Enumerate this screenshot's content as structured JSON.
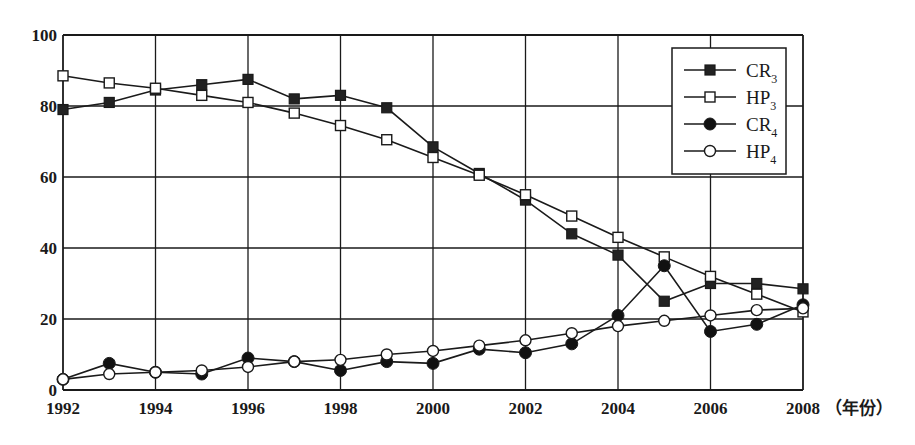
{
  "chart_data": {
    "type": "line",
    "title": "",
    "xlabel": "（年份）",
    "ylabel": "",
    "x": [
      1992,
      1993,
      1994,
      1995,
      1996,
      1997,
      1998,
      1999,
      2000,
      2001,
      2002,
      2003,
      2004,
      2005,
      2006,
      2007,
      2008
    ],
    "x_ticks": [
      "1992",
      "1994",
      "1996",
      "1998",
      "2000",
      "2002",
      "2004",
      "2006",
      "2008"
    ],
    "y_ticks": [
      "0",
      "20",
      "40",
      "60",
      "80",
      "100"
    ],
    "xlim": [
      1992,
      2008
    ],
    "ylim": [
      0,
      100
    ],
    "grid": true,
    "legend_position": "upper right",
    "series": [
      {
        "name": "CR3",
        "label_main": "CR",
        "label_sub": "3",
        "marker": "filled-square",
        "values": [
          79,
          81,
          84.5,
          86,
          87.5,
          82,
          83,
          79.5,
          68.5,
          61,
          53.5,
          44,
          38,
          25,
          30,
          30,
          28.5
        ]
      },
      {
        "name": "HP3",
        "label_main": "HP",
        "label_sub": "3",
        "marker": "open-square",
        "values": [
          88.5,
          86.5,
          85,
          83,
          81,
          78,
          74.5,
          70.5,
          65.5,
          60.5,
          55,
          49,
          43,
          37.5,
          32,
          27,
          22
        ]
      },
      {
        "name": "CR4",
        "label_main": "CR",
        "label_sub": "4",
        "marker": "filled-circle",
        "values": [
          3,
          7.5,
          5,
          4.5,
          9,
          8,
          5.5,
          8,
          7.5,
          11.5,
          10.5,
          13,
          21,
          35,
          16.5,
          18.5,
          24
        ]
      },
      {
        "name": "HP4",
        "label_main": "HP",
        "label_sub": "4",
        "marker": "open-circle",
        "values": [
          3,
          4.5,
          5,
          5.5,
          6.5,
          8,
          8.5,
          10,
          11,
          12.5,
          14,
          16,
          18,
          19.5,
          21,
          22.5,
          23
        ]
      }
    ]
  },
  "colors": {
    "line": "#1a1a1a",
    "grid": "#1a1a1a",
    "background": "#ffffff"
  }
}
